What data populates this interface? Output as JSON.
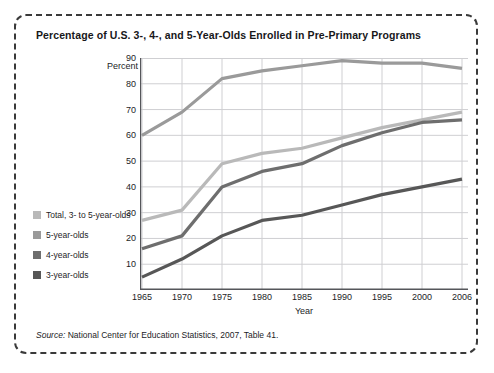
{
  "title": "Percentage of U.S. 3-, 4-, and 5-Year-Olds Enrolled in Pre-Primary Programs",
  "axis": {
    "y_label": "Percent",
    "x_label": "Year"
  },
  "source": {
    "prefix": "Source:",
    "text": " National Center for Education Statistics, 2007, Table 41."
  },
  "legend": {
    "items": [
      {
        "label": "Total, 3- to 5-year-olds",
        "color": "#b9b9b9"
      },
      {
        "label": "5-year-olds",
        "color": "#9a9a9a"
      },
      {
        "label": "4-year-olds",
        "color": "#6e6e6e"
      },
      {
        "label": "3-year-olds",
        "color": "#575757"
      }
    ]
  },
  "chart_data": {
    "type": "line",
    "title": "Percentage of U.S. 3-, 4-, and 5-Year-Olds Enrolled in Pre-Primary Programs",
    "xlabel": "Year",
    "ylabel": "Percent",
    "x": [
      1965,
      1970,
      1975,
      1980,
      1985,
      1990,
      1995,
      2000,
      2006
    ],
    "xtick_labels": [
      "1965",
      "1970",
      "1975",
      "1980",
      "1985",
      "1990",
      "1995",
      "2000",
      "2006"
    ],
    "ytick_labels": [
      "10",
      "20",
      "30",
      "40",
      "50",
      "60",
      "70",
      "80",
      "90"
    ],
    "xlim": [
      1965,
      2006
    ],
    "ylim": [
      0,
      90
    ],
    "grid": true,
    "legend_position": "left-outside",
    "series": [
      {
        "name": "5-year-olds",
        "color": "#9a9a9a",
        "values": [
          60,
          69,
          82,
          85,
          87,
          89,
          88,
          88,
          86
        ]
      },
      {
        "name": "Total, 3- to 5-year-olds",
        "color": "#b9b9b9",
        "values": [
          27,
          31,
          49,
          53,
          55,
          59,
          63,
          66,
          69
        ]
      },
      {
        "name": "4-year-olds",
        "color": "#6e6e6e",
        "values": [
          16,
          21,
          40,
          46,
          49,
          56,
          61,
          65,
          66
        ]
      },
      {
        "name": "3-year-olds",
        "color": "#575757",
        "values": [
          5,
          12,
          21,
          27,
          29,
          33,
          37,
          40,
          43
        ]
      }
    ]
  }
}
